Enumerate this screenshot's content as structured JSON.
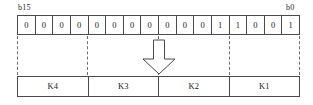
{
  "diagram": {
    "register": {
      "name": "bit-register",
      "msb_label": "b15",
      "lsb_label": "b0",
      "bit_count": 16,
      "bits": [
        "0",
        "0",
        "0",
        "0",
        "0",
        "0",
        "0",
        "0",
        "0",
        "0",
        "0",
        "1",
        "1",
        "0",
        "0",
        "1"
      ],
      "binary_string": "0000000000011001"
    },
    "arrow": {
      "name": "down-arrow-icon",
      "direction": "down"
    },
    "nibbles": {
      "name": "nibble-row",
      "cells": [
        {
          "label": "K4"
        },
        {
          "label": "K3"
        },
        {
          "label": "K2"
        },
        {
          "label": "K1"
        }
      ]
    },
    "colors": {
      "line": "#4a4a4a",
      "dashed_guide": "#6e6e6e",
      "text": "#1a1a1a",
      "background": "#ffffff"
    }
  }
}
